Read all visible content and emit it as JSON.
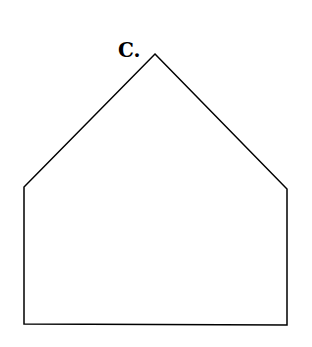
{
  "diagram": {
    "label": "C.",
    "shape": "pentagon",
    "stroke_color": "#000000",
    "fill_color": "#ffffff",
    "vertices": [
      [
        155,
        54
      ],
      [
        287,
        189
      ],
      [
        287,
        325
      ],
      [
        24,
        324
      ],
      [
        24,
        187
      ]
    ]
  }
}
